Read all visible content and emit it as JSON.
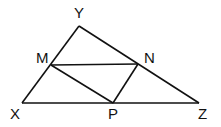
{
  "diagram": {
    "type": "geometry-triangle",
    "stroke_color": "#111111",
    "points": {
      "Y": {
        "label": "Y",
        "x": 79,
        "y": 26
      },
      "X": {
        "label": "X",
        "x": 22,
        "y": 103
      },
      "Z": {
        "label": "Z",
        "x": 199,
        "y": 103
      },
      "M": {
        "label": "M",
        "x": 51,
        "y": 65
      },
      "N": {
        "label": "N",
        "x": 138,
        "y": 64
      },
      "P": {
        "label": "P",
        "x": 113,
        "y": 103
      }
    },
    "segments": [
      "XY",
      "YZ",
      "XZ",
      "MN",
      "MP",
      "NP"
    ]
  }
}
